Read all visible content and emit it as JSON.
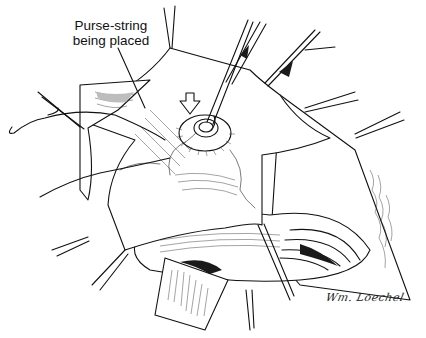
{
  "figure": {
    "annotation": {
      "line1": "Purse-string",
      "line2": "being placed"
    },
    "signature": "Wm. Loechel",
    "colors": {
      "background": "#ffffff",
      "ink": "#111111"
    },
    "icons": [
      "arrow-down-indicator",
      "forceps",
      "clamp",
      "suture-needle"
    ]
  }
}
